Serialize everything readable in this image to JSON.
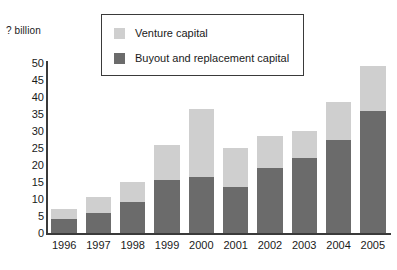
{
  "chart_data": {
    "type": "bar",
    "stacked": true,
    "title": "",
    "subtitle": "",
    "xlabel": "",
    "ylabel": "? billion",
    "ylim": [
      0,
      50
    ],
    "ytick_step": 5,
    "yticks": [
      "50",
      "45",
      "40",
      "35",
      "30",
      "25",
      "20",
      "15",
      "10",
      "5",
      "0"
    ],
    "grid": false,
    "legend_position": "top-center",
    "categories": [
      "1996",
      "1997",
      "1998",
      "1999",
      "2000",
      "2001",
      "2002",
      "2003",
      "2004",
      "2005"
    ],
    "series": [
      {
        "name": "Buyout and replacement capital",
        "color": "#6b6b6b",
        "values": [
          4,
          6,
          9,
          15.5,
          16.5,
          13.5,
          19,
          22,
          27.5,
          36
        ]
      },
      {
        "name": "Venture capital",
        "color": "#cfcfcf",
        "values": [
          3,
          4.5,
          6,
          10.5,
          20,
          11.5,
          9.5,
          8,
          11,
          13
        ]
      }
    ],
    "totals": [
      7,
      10.5,
      15,
      26,
      36.5,
      25,
      28.5,
      30,
      38.5,
      49
    ]
  },
  "legend": {
    "items": [
      {
        "label": "Venture capital",
        "color": "#cfcfcf"
      },
      {
        "label": "Buyout and replacement capital",
        "color": "#6b6b6b"
      }
    ]
  }
}
